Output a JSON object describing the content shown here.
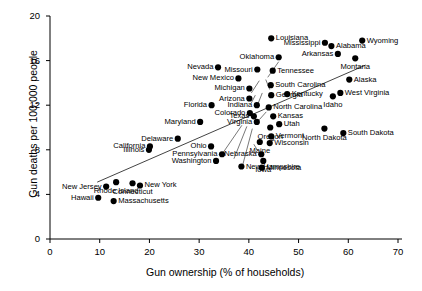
{
  "chart_data": {
    "type": "scatter",
    "title": "",
    "xlabel": "Gun ownership (% of households)",
    "ylabel": "Gun deaths per 100,000 people",
    "xlim": [
      0,
      70
    ],
    "ylim": [
      0,
      20
    ],
    "xticks": [
      0,
      10,
      20,
      30,
      40,
      50,
      60,
      70
    ],
    "yticks": [
      0,
      4,
      8,
      12,
      16,
      20
    ],
    "grid": false,
    "legend": null,
    "trendline": {
      "x1": 9.5,
      "y1": 5.1,
      "x2": 63.5,
      "y2": 15.6,
      "style": "solid"
    },
    "point_color": "#000000",
    "points": [
      {
        "label": "Louisiana",
        "x": 44.5,
        "y": 18.0,
        "anchor": "l"
      },
      {
        "label": "Wyoming",
        "x": 62.8,
        "y": 17.8,
        "anchor": "l"
      },
      {
        "label": "Mississippi",
        "x": 55.3,
        "y": 17.6,
        "anchor": "r"
      },
      {
        "label": "Alabama",
        "x": 56.6,
        "y": 17.3,
        "anchor": "l"
      },
      {
        "label": "Arkansas",
        "x": 57.9,
        "y": 16.6,
        "anchor": "r"
      },
      {
        "label": "Montana",
        "x": 61.4,
        "y": 16.2,
        "anchor": "c"
      },
      {
        "label": "Oklahoma",
        "x": 46.0,
        "y": 16.3,
        "anchor": "r"
      },
      {
        "label": "Nevada",
        "x": 33.8,
        "y": 15.4,
        "anchor": "r"
      },
      {
        "label": "Missouri",
        "x": 41.7,
        "y": 15.2,
        "anchor": "r"
      },
      {
        "label": "Tennessee",
        "x": 44.8,
        "y": 15.1,
        "anchor": "l"
      },
      {
        "label": "New Mexico",
        "x": 37.9,
        "y": 14.4,
        "anchor": "r"
      },
      {
        "label": "South Carolina",
        "x": 44.4,
        "y": 13.8,
        "anchor": "l"
      },
      {
        "label": "Alaska",
        "x": 60.2,
        "y": 14.3,
        "anchor": "l"
      },
      {
        "label": "Michigan",
        "x": 40.1,
        "y": 13.5,
        "anchor": "r"
      },
      {
        "label": "Kentucky",
        "x": 47.7,
        "y": 13.0,
        "anchor": "l"
      },
      {
        "label": "West Virginia",
        "x": 58.4,
        "y": 13.1,
        "anchor": "l"
      },
      {
        "label": "Georgia",
        "x": 44.5,
        "y": 12.9,
        "anchor": "l"
      },
      {
        "label": "Idaho",
        "x": 56.9,
        "y": 12.8,
        "anchor": "c"
      },
      {
        "label": "Florida",
        "x": 32.5,
        "y": 12.0,
        "anchor": "r"
      },
      {
        "label": "Arizona",
        "x": 40.1,
        "y": 12.6,
        "anchor": "r"
      },
      {
        "label": "Indiana",
        "x": 41.6,
        "y": 12.0,
        "anchor": "r"
      },
      {
        "label": "North Carolina",
        "x": 44.0,
        "y": 11.8,
        "anchor": "l"
      },
      {
        "label": "Colorado",
        "x": 40.2,
        "y": 11.3,
        "anchor": "r"
      },
      {
        "label": "Texas",
        "x": 41.0,
        "y": 11.0,
        "anchor": "r"
      },
      {
        "label": "Kansas",
        "x": 44.9,
        "y": 11.0,
        "anchor": "l"
      },
      {
        "label": "Virginia",
        "x": 41.6,
        "y": 10.5,
        "anchor": "r"
      },
      {
        "label": "Maryland",
        "x": 30.2,
        "y": 10.5,
        "anchor": "r"
      },
      {
        "label": "Utah",
        "x": 46.1,
        "y": 10.3,
        "anchor": "l"
      },
      {
        "label": "Oregon",
        "x": 44.3,
        "y": 10.0,
        "anchor": "c"
      },
      {
        "label": "North Dakota",
        "x": 55.2,
        "y": 9.9,
        "anchor": "c"
      },
      {
        "label": "South Dakota",
        "x": 59.0,
        "y": 9.5,
        "anchor": "l"
      },
      {
        "label": "Vermont",
        "x": 44.5,
        "y": 9.2,
        "anchor": "l"
      },
      {
        "label": "Delaware",
        "x": 25.7,
        "y": 9.0,
        "anchor": "r"
      },
      {
        "label": "Wisconsin",
        "x": 44.2,
        "y": 8.6,
        "anchor": "l"
      },
      {
        "label": "Maine",
        "x": 42.2,
        "y": 8.7,
        "anchor": "c"
      },
      {
        "label": "Ohio",
        "x": 32.4,
        "y": 8.3,
        "anchor": "r"
      },
      {
        "label": "California",
        "x": 20.1,
        "y": 8.3,
        "anchor": "r"
      },
      {
        "label": "Illinois",
        "x": 19.9,
        "y": 8.0,
        "anchor": "r"
      },
      {
        "label": "Pennsylvania",
        "x": 34.6,
        "y": 7.6,
        "anchor": "r"
      },
      {
        "label": "Nebraska",
        "x": 42.5,
        "y": 7.6,
        "anchor": "r"
      },
      {
        "label": "Washington",
        "x": 33.4,
        "y": 7.0,
        "anchor": "r"
      },
      {
        "label": "Iowa",
        "x": 42.9,
        "y": 7.0,
        "anchor": "c"
      },
      {
        "label": "New Hampshire",
        "x": 38.5,
        "y": 6.5,
        "anchor": "l"
      },
      {
        "label": "Minnesota",
        "x": 42.6,
        "y": 6.4,
        "anchor": "l"
      },
      {
        "label": "Connecticut",
        "x": 16.6,
        "y": 5.0,
        "anchor": "c"
      },
      {
        "label": "Rhode Island",
        "x": 13.3,
        "y": 5.1,
        "anchor": "c"
      },
      {
        "label": "New York",
        "x": 18.1,
        "y": 4.8,
        "anchor": "l"
      },
      {
        "label": "New Jersey",
        "x": 11.3,
        "y": 4.7,
        "anchor": "r"
      },
      {
        "label": "Hawaii",
        "x": 9.7,
        "y": 3.7,
        "anchor": "r"
      },
      {
        "label": "Massachusetts",
        "x": 12.8,
        "y": 3.4,
        "anchor": "l"
      }
    ],
    "leader_lines": [
      {
        "x1": 46.0,
        "y1": 15.9,
        "x2": 43.8,
        "y2": 14.5
      },
      {
        "x1": 44.2,
        "y1": 13.4,
        "x2": 43.4,
        "y2": 14.3
      },
      {
        "x1": 40.5,
        "y1": 13.1,
        "x2": 42.1,
        "y2": 14.2
      },
      {
        "x1": 41.9,
        "y1": 12.2,
        "x2": 42.7,
        "y2": 13.1
      },
      {
        "x1": 40.5,
        "y1": 12.2,
        "x2": 41.3,
        "y2": 12.9
      },
      {
        "x1": 43.5,
        "y1": 11.4,
        "x2": 42.1,
        "y2": 10.7
      },
      {
        "x1": 34.9,
        "y1": 7.8,
        "x2": 38.6,
        "y2": 10.2
      },
      {
        "x1": 37.0,
        "y1": 7.2,
        "x2": 39.6,
        "y2": 10.1
      },
      {
        "x1": 38.8,
        "y1": 6.7,
        "x2": 40.7,
        "y2": 9.9
      },
      {
        "x1": 41.8,
        "y1": 7.9,
        "x2": 41.0,
        "y2": 8.5
      }
    ]
  }
}
